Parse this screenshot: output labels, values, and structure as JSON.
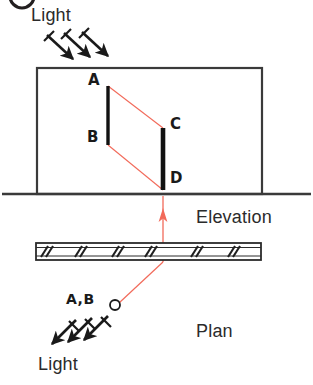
{
  "figure": {
    "width": 313,
    "height": 385,
    "background_color": "#ffffff"
  },
  "colors": {
    "ink": "#231f20",
    "line": "#3a3a3a",
    "ray": "#f26a5a",
    "solid_fill": "#111111",
    "caption_text": "#2b2b2b"
  },
  "labels": {
    "light_top": "Light",
    "light_bottom": "Light",
    "elevation": "Elevation",
    "plan": "Plan",
    "point_a": "A",
    "point_b": "B",
    "point_c": "C",
    "point_d": "D",
    "point_ab_plan": "A,B"
  },
  "elevation_view": {
    "name": "elevation",
    "wall_box": {
      "x": 37,
      "y": 68,
      "width": 225,
      "height": 126
    },
    "ground_line": {
      "x1": 2,
      "y1": 194,
      "x2": 311,
      "y2": 194
    },
    "object_bar_ab": {
      "label_top": "A",
      "label_bottom": "B",
      "x": 108,
      "y_top": 86,
      "y_bottom": 145
    },
    "shadow_bar_cd": {
      "label_top": "C",
      "label_bottom": "D",
      "x": 163,
      "y_top": 128,
      "y_bottom": 190
    },
    "ray_a_to_c": {
      "from": "A",
      "to": "C",
      "x1": 108,
      "y1": 86,
      "x2": 163,
      "y2": 128
    },
    "ray_b_to_d": {
      "from": "B",
      "to": "D",
      "x1": 108,
      "y1": 145,
      "x2": 163,
      "y2": 190
    }
  },
  "plan_view": {
    "name": "plan",
    "slab": {
      "x": 36,
      "y": 243,
      "width": 225,
      "height": 17,
      "hatch_pair_count": 6
    },
    "object_point": {
      "label": "A,B",
      "x": 115,
      "y": 305,
      "radius": 5
    },
    "ray_to_slab": {
      "x1": 115,
      "y1": 305,
      "x2": 163,
      "y2": 262
    },
    "projector_vertical": {
      "x": 163,
      "y_bottom": 262,
      "y_top": 196,
      "arrow_tip_y": 210
    }
  },
  "light_arrows_top": {
    "name": "incident-light-elevation",
    "direction": "down-right",
    "count": 3,
    "arrows": [
      {
        "x1": 47,
        "y1": 35,
        "x2": 75,
        "y2": 61
      },
      {
        "x1": 64,
        "y1": 33,
        "x2": 92,
        "y2": 59
      },
      {
        "x1": 82,
        "y1": 32,
        "x2": 110,
        "y2": 58
      }
    ]
  },
  "light_arrows_bottom": {
    "name": "incident-light-plan",
    "direction": "down-left",
    "count": 3,
    "arrows": [
      {
        "x1": 110,
        "y1": 316,
        "x2": 82,
        "y2": 342
      },
      {
        "x1": 94,
        "y1": 318,
        "x2": 66,
        "y2": 344
      },
      {
        "x1": 78,
        "y1": 320,
        "x2": 50,
        "y2": 346
      }
    ]
  },
  "figure_marker": {
    "name": "figure-number-circle",
    "note": "partial circle clipped at top edge",
    "cx": 22,
    "cy": -4,
    "r": 12
  }
}
